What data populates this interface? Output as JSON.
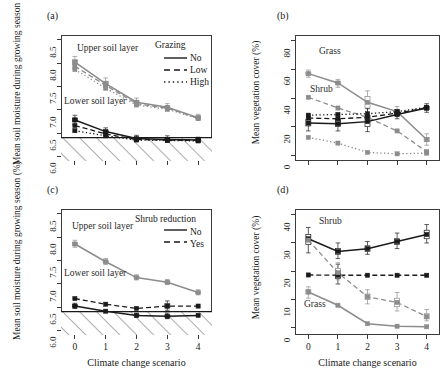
{
  "figure": {
    "panels": [
      "(a)",
      "(b)",
      "(c)",
      "(d)"
    ],
    "xlabel": "Climate change scenario",
    "xticks": [
      "0",
      "1",
      "2",
      "3",
      "4"
    ]
  },
  "chart_data": [
    {
      "panel": "(a)",
      "type": "line",
      "title": "(a)",
      "xlabel": "",
      "ylabel": "Mean soil moisture during growing season (%)",
      "x": [
        0,
        1,
        2,
        3,
        4
      ],
      "xlim": [
        -0.45,
        4.45
      ],
      "ylim": [
        5.9,
        8.6
      ],
      "yticks": [
        6.0,
        6.5,
        7.0,
        7.5,
        8.0,
        8.5
      ],
      "ytick_labels": [
        "6.0",
        "6.5",
        "7.0",
        "7.5",
        "8.0",
        "8.5"
      ],
      "xticks": [
        0,
        1,
        2,
        3,
        4
      ],
      "xtick_labels": [
        "",
        "",
        "",
        "",
        ""
      ],
      "grid": false,
      "legend_title": "Grazing",
      "legend": [
        "No",
        "Low",
        "High"
      ],
      "legend_position": "top-right",
      "annotations": [
        "Upper soil layer",
        "Lower soil layer"
      ],
      "wilting_point": 6.4,
      "series": [
        {
          "name": "Upper soil layer – No",
          "group": "upper",
          "style": "solid",
          "color": "#8c8c8c",
          "values": [
            8.02,
            7.56,
            7.16,
            7.05,
            6.83
          ]
        },
        {
          "name": "Upper soil layer – Low",
          "group": "upper",
          "style": "dashed",
          "color": "#8c8c8c",
          "values": [
            7.93,
            7.52,
            7.13,
            7.03,
            6.82
          ]
        },
        {
          "name": "Upper soil layer – High",
          "group": "upper",
          "style": "dotted",
          "color": "#8c8c8c",
          "values": [
            7.86,
            7.46,
            7.1,
            7.01,
            6.81
          ]
        },
        {
          "name": "Lower soil layer – No",
          "group": "lower",
          "style": "solid",
          "color": "#1a1a1a",
          "values": [
            6.78,
            6.53,
            6.38,
            6.36,
            6.35
          ]
        },
        {
          "name": "Lower soil layer – Low",
          "group": "lower",
          "style": "dashed",
          "color": "#1a1a1a",
          "values": [
            6.66,
            6.48,
            6.36,
            6.35,
            6.34
          ]
        },
        {
          "name": "Lower soil layer – High",
          "group": "lower",
          "style": "dotted",
          "color": "#1a1a1a",
          "values": [
            6.55,
            6.44,
            6.35,
            6.34,
            6.33
          ]
        }
      ],
      "boxplots": [
        {
          "series": 0,
          "x": 0,
          "lo": 7.88,
          "q1": 7.97,
          "med": 8.02,
          "q3": 8.07,
          "hi": 8.14
        },
        {
          "series": 0,
          "x": 1,
          "lo": 7.44,
          "q1": 7.52,
          "med": 7.56,
          "q3": 7.61,
          "hi": 7.68
        },
        {
          "series": 0,
          "x": 2,
          "lo": 7.07,
          "q1": 7.13,
          "med": 7.16,
          "q3": 7.2,
          "hi": 7.25
        },
        {
          "series": 0,
          "x": 3,
          "lo": 6.97,
          "q1": 7.02,
          "med": 7.05,
          "q3": 7.08,
          "hi": 7.13
        },
        {
          "series": 0,
          "x": 4,
          "lo": 6.77,
          "q1": 6.81,
          "med": 6.83,
          "q3": 6.86,
          "hi": 6.9
        },
        {
          "series": 3,
          "x": 0,
          "lo": 6.68,
          "q1": 6.74,
          "med": 6.78,
          "q3": 6.82,
          "hi": 6.88
        },
        {
          "series": 3,
          "x": 1,
          "lo": 6.45,
          "q1": 6.5,
          "med": 6.53,
          "q3": 6.56,
          "hi": 6.61
        },
        {
          "series": 3,
          "x": 2,
          "lo": 6.32,
          "q1": 6.36,
          "med": 6.38,
          "q3": 6.41,
          "hi": 6.45
        },
        {
          "series": 3,
          "x": 3,
          "lo": 6.3,
          "q1": 6.34,
          "med": 6.36,
          "q3": 6.39,
          "hi": 6.44
        },
        {
          "series": 3,
          "x": 4,
          "lo": 6.3,
          "q1": 6.33,
          "med": 6.35,
          "q3": 6.37,
          "hi": 6.41
        }
      ]
    },
    {
      "panel": "(b)",
      "type": "line",
      "title": "(b)",
      "xlabel": "",
      "ylabel": "Mean vegetation cover (%)",
      "x": [
        0,
        1,
        2,
        3,
        4
      ],
      "xlim": [
        -0.45,
        4.45
      ],
      "ylim": [
        -4,
        84
      ],
      "yticks": [
        0,
        20,
        40,
        60,
        80
      ],
      "ytick_labels": [
        "0",
        "20",
        "40",
        "60",
        "80"
      ],
      "xticks": [
        0,
        1,
        2,
        3,
        4
      ],
      "xtick_labels": [
        "",
        "",
        "",
        "",
        ""
      ],
      "grid": false,
      "legend_title": "Grazing",
      "legend": [
        "No",
        "Low",
        "High"
      ],
      "annotations": [
        "Grass",
        "Shrub"
      ],
      "series": [
        {
          "name": "Grass – No",
          "group": "grass",
          "style": "solid",
          "color": "#8c8c8c",
          "values": [
            57.0,
            50.5,
            37.0,
            30.5,
            11.0
          ]
        },
        {
          "name": "Grass – Low",
          "group": "grass",
          "style": "dashed",
          "color": "#8c8c8c",
          "values": [
            40.5,
            33.0,
            26.5,
            17.0,
            2.5
          ]
        },
        {
          "name": "Grass – High",
          "group": "grass",
          "style": "dotted",
          "color": "#8c8c8c",
          "values": [
            12.5,
            8.5,
            2.0,
            1.0,
            1.5
          ]
        },
        {
          "name": "Shrub – No",
          "group": "shrub",
          "style": "solid",
          "color": "#1a1a1a",
          "values": [
            22.5,
            22.0,
            23.5,
            28.5,
            33.0
          ]
        },
        {
          "name": "Shrub – Low",
          "group": "shrub",
          "style": "dashed",
          "color": "#1a1a1a",
          "values": [
            26.0,
            25.5,
            26.5,
            29.5,
            33.0
          ]
        },
        {
          "name": "Shrub – High",
          "group": "shrub",
          "style": "dotted",
          "color": "#1a1a1a",
          "values": [
            28.0,
            28.5,
            29.0,
            30.5,
            33.5
          ]
        }
      ],
      "boxplots": [
        {
          "series": 0,
          "x": 0,
          "lo": 54.5,
          "q1": 56.0,
          "med": 57.0,
          "q3": 58.0,
          "hi": 59.5
        },
        {
          "series": 0,
          "x": 1,
          "lo": 47.5,
          "q1": 49.5,
          "med": 50.5,
          "q3": 51.5,
          "hi": 53.0
        },
        {
          "series": 0,
          "x": 2,
          "lo": 28.0,
          "q1": 33.0,
          "med": 37.0,
          "q3": 41.0,
          "hi": 45.0
        },
        {
          "series": 0,
          "x": 3,
          "lo": 27.0,
          "q1": 29.0,
          "med": 30.5,
          "q3": 32.0,
          "hi": 34.0
        },
        {
          "series": 0,
          "x": 4,
          "lo": 7.0,
          "q1": 9.5,
          "med": 11.0,
          "q3": 12.5,
          "hi": 15.0
        },
        {
          "series": 3,
          "x": 0,
          "lo": 17.0,
          "q1": 20.5,
          "med": 22.5,
          "q3": 25.0,
          "hi": 28.5
        },
        {
          "series": 3,
          "x": 1,
          "lo": 17.0,
          "q1": 20.0,
          "med": 22.0,
          "q3": 25.0,
          "hi": 28.0
        },
        {
          "series": 3,
          "x": 2,
          "lo": 16.5,
          "q1": 20.0,
          "med": 23.5,
          "q3": 28.0,
          "hi": 32.5
        },
        {
          "series": 3,
          "x": 3,
          "lo": 25.5,
          "q1": 27.5,
          "med": 28.5,
          "q3": 30.0,
          "hi": 32.0
        },
        {
          "series": 3,
          "x": 4,
          "lo": 30.0,
          "q1": 32.0,
          "med": 33.0,
          "q3": 34.0,
          "hi": 36.0
        }
      ]
    },
    {
      "panel": "(c)",
      "type": "line",
      "title": "(c)",
      "xlabel": "Climate change scenario",
      "ylabel": "Mean soil moisture during growing season (%)",
      "x": [
        0,
        1,
        2,
        3,
        4
      ],
      "xlim": [
        -0.45,
        4.45
      ],
      "ylim": [
        5.9,
        8.6
      ],
      "yticks": [
        6.0,
        6.5,
        7.0,
        7.5,
        8.0,
        8.5
      ],
      "ytick_labels": [
        "6.0",
        "6.5",
        "7.0",
        "7.5",
        "8.0",
        "8.5"
      ],
      "xticks": [
        0,
        1,
        2,
        3,
        4
      ],
      "xtick_labels": [
        "0",
        "1",
        "2",
        "3",
        "4"
      ],
      "grid": false,
      "legend_title": "Shrub reduction",
      "legend": [
        "No",
        "Yes"
      ],
      "annotations": [
        "Upper soil layer",
        "Lower soil layer"
      ],
      "wilting_point": 6.4,
      "series": [
        {
          "name": "Upper soil layer – No",
          "group": "upper",
          "style": "solid",
          "color": "#8c8c8c",
          "values": [
            7.85,
            7.47,
            7.13,
            7.03,
            6.81
          ]
        },
        {
          "name": "Lower soil layer – No",
          "group": "lower",
          "style": "solid",
          "color": "#1a1a1a",
          "values": [
            6.52,
            6.41,
            6.32,
            6.3,
            6.32
          ]
        },
        {
          "name": "Lower soil layer – Yes",
          "group": "lower",
          "style": "dashed",
          "color": "#1a1a1a",
          "values": [
            6.68,
            6.56,
            6.47,
            6.52,
            6.52
          ]
        }
      ],
      "boxplots": [
        {
          "series": 0,
          "x": 0,
          "lo": 7.78,
          "q1": 7.82,
          "med": 7.85,
          "q3": 7.88,
          "hi": 7.93
        },
        {
          "series": 0,
          "x": 1,
          "lo": 7.41,
          "q1": 7.45,
          "med": 7.47,
          "q3": 7.5,
          "hi": 7.54
        },
        {
          "series": 0,
          "x": 2,
          "lo": 7.08,
          "q1": 7.11,
          "med": 7.13,
          "q3": 7.16,
          "hi": 7.19
        },
        {
          "series": 0,
          "x": 3,
          "lo": 6.98,
          "q1": 7.01,
          "med": 7.03,
          "q3": 7.06,
          "hi": 7.09
        },
        {
          "series": 0,
          "x": 4,
          "lo": 6.76,
          "q1": 6.79,
          "med": 6.81,
          "q3": 6.83,
          "hi": 6.87
        },
        {
          "series": 1,
          "x": 0,
          "lo": 6.47,
          "q1": 6.5,
          "med": 6.52,
          "q3": 6.55,
          "hi": 6.58
        },
        {
          "series": 1,
          "x": 2,
          "lo": 6.28,
          "q1": 6.31,
          "med": 6.32,
          "q3": 6.34,
          "hi": 6.37
        },
        {
          "series": 1,
          "x": 3,
          "lo": 6.25,
          "q1": 6.28,
          "med": 6.3,
          "q3": 6.33,
          "hi": 6.37
        },
        {
          "series": 2,
          "x": 3,
          "lo": 6.43,
          "q1": 6.48,
          "med": 6.52,
          "q3": 6.57,
          "hi": 6.63
        }
      ]
    },
    {
      "panel": "(d)",
      "type": "line",
      "title": "(d)",
      "xlabel": "Climate change scenario",
      "ylabel": "Mean vegetation cover (%)",
      "x": [
        0,
        1,
        2,
        3,
        4
      ],
      "xlim": [
        -0.45,
        4.45
      ],
      "ylim": [
        -2.5,
        42
      ],
      "yticks": [
        0,
        10,
        20,
        30,
        40
      ],
      "ytick_labels": [
        "0",
        "10",
        "20",
        "30",
        "40"
      ],
      "xticks": [
        0,
        1,
        2,
        3,
        4
      ],
      "xtick_labels": [
        "0",
        "1",
        "2",
        "3",
        "4"
      ],
      "grid": false,
      "legend_title": "Shrub reduction",
      "legend": [
        "No",
        "Yes"
      ],
      "annotations": [
        "Shrub",
        "Grass"
      ],
      "series": [
        {
          "name": "Shrub – No",
          "group": "shrub",
          "style": "solid",
          "color": "#1a1a1a",
          "values": [
            31.5,
            27.0,
            28.0,
            30.5,
            33.0
          ]
        },
        {
          "name": "Shrub – Yes",
          "group": "shrub",
          "style": "dashed",
          "color": "#1a1a1a",
          "values": [
            18.7,
            18.6,
            18.6,
            18.6,
            18.6
          ]
        },
        {
          "name": "Grass – No",
          "group": "grass",
          "style": "solid",
          "color": "#8c8c8c",
          "values": [
            12.7,
            8.0,
            1.5,
            0.6,
            0.4
          ]
        },
        {
          "name": "Grass – Yes",
          "group": "grass",
          "style": "dashed",
          "color": "#8c8c8c",
          "values": [
            31.0,
            19.5,
            11.0,
            9.0,
            4.0
          ]
        }
      ],
      "boxplots": [
        {
          "series": 0,
          "x": 0,
          "lo": 26.5,
          "q1": 29.5,
          "med": 31.5,
          "q3": 33.0,
          "hi": 35.5
        },
        {
          "series": 0,
          "x": 1,
          "lo": 24.5,
          "q1": 26.0,
          "med": 27.0,
          "q3": 28.0,
          "hi": 30.0
        },
        {
          "series": 0,
          "x": 2,
          "lo": 26.0,
          "q1": 27.0,
          "med": 28.0,
          "q3": 29.0,
          "hi": 30.5
        },
        {
          "series": 0,
          "x": 3,
          "lo": 28.0,
          "q1": 29.5,
          "med": 30.5,
          "q3": 31.5,
          "hi": 33.5
        },
        {
          "series": 0,
          "x": 4,
          "lo": 30.0,
          "q1": 31.5,
          "med": 33.0,
          "q3": 34.5,
          "hi": 36.5
        },
        {
          "series": 1,
          "x": 1,
          "lo": 15.5,
          "q1": 17.5,
          "med": 18.6,
          "q3": 20.5,
          "hi": 22.5
        },
        {
          "series": 2,
          "x": 0,
          "lo": 10.5,
          "q1": 12.0,
          "med": 12.7,
          "q3": 13.5,
          "hi": 14.5
        },
        {
          "series": 3,
          "x": 1,
          "lo": 17.0,
          "q1": 18.5,
          "med": 19.5,
          "q3": 21.0,
          "hi": 23.0
        },
        {
          "series": 3,
          "x": 2,
          "lo": 8.5,
          "q1": 10.0,
          "med": 11.0,
          "q3": 12.0,
          "hi": 13.5
        },
        {
          "series": 3,
          "x": 3,
          "lo": 6.0,
          "q1": 7.5,
          "med": 9.0,
          "q3": 10.5,
          "hi": 12.5
        },
        {
          "series": 3,
          "x": 4,
          "lo": 2.5,
          "q1": 3.2,
          "med": 4.0,
          "q3": 5.0,
          "hi": 6.5
        }
      ]
    }
  ]
}
